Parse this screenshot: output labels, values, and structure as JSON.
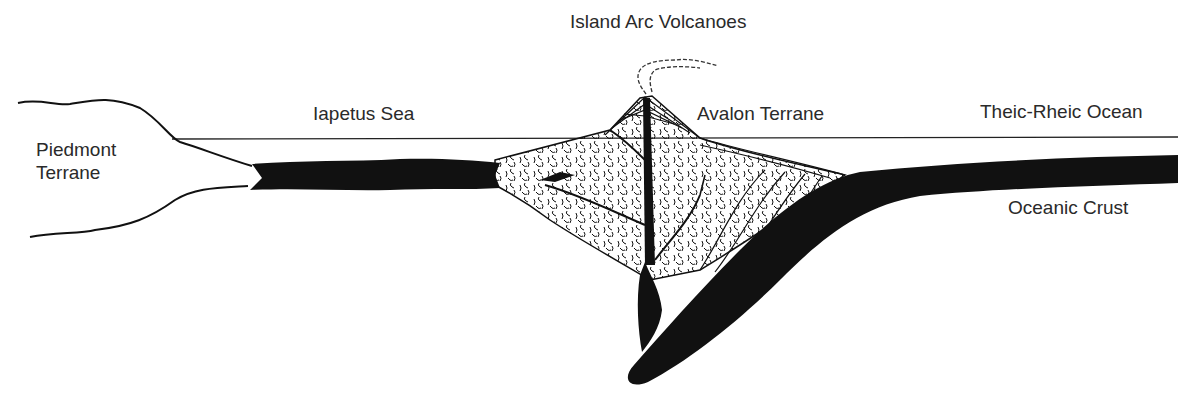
{
  "diagram": {
    "type": "geologic-cross-section",
    "colors": {
      "ink": "#111111",
      "background": "#ffffff",
      "text": "#2a2a2a"
    },
    "labels": {
      "island_arc": "Island Arc Volcanoes",
      "iapetus": "Iapetus Sea",
      "avalon": "Avalon Terrane",
      "theic": "Theic-Rheic Ocean",
      "piedmont_line1": "Piedmont",
      "piedmont_line2": "Terrane",
      "oceanic_crust": "Oceanic Crust"
    },
    "features": [
      "sea-level-line",
      "piedmont-terrane-landmass",
      "iapetus-oceanic-crust-slab",
      "island-arc-volcano-with-plume",
      "accretionary-wedge-strata",
      "subducting-oceanic-crust",
      "magma-conduit"
    ]
  }
}
